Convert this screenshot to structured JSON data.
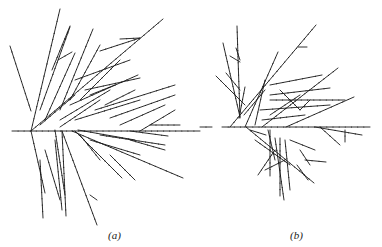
{
  "figure": {
    "panels": [
      {
        "id": "a",
        "caption": "(a)",
        "description": "branching tree structure grown from a root point, spreading to the right"
      },
      {
        "id": "b",
        "caption": "(b)",
        "description": "branching tree structure grown from a root point, more compact, spreading to the right"
      }
    ],
    "line_color": "#1a1a1a",
    "background": "#ffffff"
  }
}
